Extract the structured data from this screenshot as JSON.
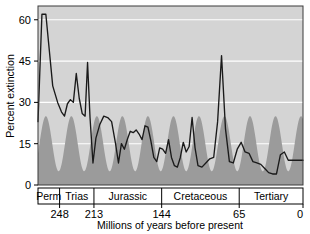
{
  "chart_data": {
    "type": "line",
    "title": "",
    "xlabel": "Millions of years before present",
    "ylabel": "Percent extinction",
    "xlim": [
      270,
      0
    ],
    "ylim": [
      0,
      65
    ],
    "x_ticks": [
      248,
      213,
      144,
      65,
      0
    ],
    "x_tick_labels": [
      "248",
      "213",
      "144",
      "65",
      "0"
    ],
    "y_ticks": [
      0,
      15,
      30,
      45,
      60
    ],
    "y_tick_labels": [
      "0",
      "15",
      "30",
      "45",
      "60"
    ],
    "grid": "horizontal-white-at-y-ticks",
    "legend": "none",
    "x_axis_direction": "reversed",
    "periods": [
      {
        "name": "Perm",
        "start": 270,
        "end": 248
      },
      {
        "name": "Trias",
        "start": 248,
        "end": 213
      },
      {
        "name": "Jurassic",
        "start": 213,
        "end": 144
      },
      {
        "name": "Cretaceous",
        "start": 144,
        "end": 65
      },
      {
        "name": "Tertiary",
        "start": 65,
        "end": 0
      }
    ],
    "series": [
      {
        "name": "Percent extinction",
        "style": "line",
        "color": "#1a1a1a",
        "points": [
          [
            270.0,
            23.0
          ],
          [
            266.0,
            62.0
          ],
          [
            262.0,
            62.0
          ],
          [
            255.0,
            36.0
          ],
          [
            250.0,
            30.0
          ],
          [
            246.0,
            26.5
          ],
          [
            243.0,
            25.0
          ],
          [
            240.0,
            29.5
          ],
          [
            237.0,
            31.0
          ],
          [
            234.0,
            30.0
          ],
          [
            231.0,
            40.5
          ],
          [
            228.0,
            31.5
          ],
          [
            225.0,
            26.0
          ],
          [
            222.0,
            25.0
          ],
          [
            219.5,
            44.5
          ],
          [
            217.0,
            24.5
          ],
          [
            214.0,
            8.0
          ],
          [
            211.0,
            17.0
          ],
          [
            207.0,
            22.0
          ],
          [
            203.0,
            25.0
          ],
          [
            199.0,
            24.5
          ],
          [
            195.0,
            23.0
          ],
          [
            191.0,
            15.0
          ],
          [
            188.0,
            8.0
          ],
          [
            185.0,
            15.0
          ],
          [
            182.0,
            13.0
          ],
          [
            179.0,
            16.5
          ],
          [
            176.0,
            19.5
          ],
          [
            173.0,
            19.0
          ],
          [
            170.0,
            20.0
          ],
          [
            167.0,
            18.5
          ],
          [
            164.0,
            16.5
          ],
          [
            161.0,
            21.5
          ],
          [
            158.0,
            21.0
          ],
          [
            155.0,
            16.0
          ],
          [
            152.0,
            10.0
          ],
          [
            149.0,
            8.5
          ],
          [
            146.0,
            13.5
          ],
          [
            143.0,
            13.0
          ],
          [
            140.0,
            11.5
          ],
          [
            137.0,
            16.5
          ],
          [
            134.0,
            10.0
          ],
          [
            131.0,
            7.0
          ],
          [
            128.0,
            6.5
          ],
          [
            125.0,
            10.0
          ],
          [
            122.0,
            15.5
          ],
          [
            119.0,
            12.0
          ],
          [
            116.0,
            14.0
          ],
          [
            113.0,
            24.5
          ],
          [
            110.0,
            13.5
          ],
          [
            107.0,
            7.0
          ],
          [
            103.0,
            6.5
          ],
          [
            99.0,
            8.0
          ],
          [
            95.0,
            9.5
          ],
          [
            91.0,
            10.0
          ],
          [
            87.0,
            23.0
          ],
          [
            83.0,
            47.0
          ],
          [
            79.0,
            20.5
          ],
          [
            75.0,
            8.5
          ],
          [
            71.0,
            8.0
          ],
          [
            67.0,
            13.0
          ],
          [
            63.0,
            15.5
          ],
          [
            59.0,
            12.0
          ],
          [
            55.0,
            11.5
          ],
          [
            51.0,
            8.5
          ],
          [
            47.0,
            8.0
          ],
          [
            43.0,
            7.5
          ],
          [
            39.0,
            6.0
          ],
          [
            35.0,
            4.5
          ],
          [
            31.0,
            4.0
          ],
          [
            27.0,
            4.0
          ],
          [
            23.0,
            11.0
          ],
          [
            19.0,
            12.0
          ],
          [
            15.0,
            9.0
          ],
          [
            11.0,
            9.0
          ],
          [
            7.0,
            9.0
          ],
          [
            3.0,
            9.0
          ],
          [
            0.0,
            9.0
          ]
        ]
      },
      {
        "name": "26-million-year periodicity band",
        "style": "filled-area",
        "color": "#9b9b9b",
        "description": "Smooth sinusoidal shaded region, period 26 Myr, oscillating between about 5 and 25 percent",
        "amplitude_min": 5.0,
        "amplitude_max": 25.0,
        "period_myr": 26.0,
        "peak_positions": [
          262,
          236,
          210,
          184,
          158,
          132,
          106,
          80,
          54,
          28,
          2
        ]
      }
    ]
  }
}
